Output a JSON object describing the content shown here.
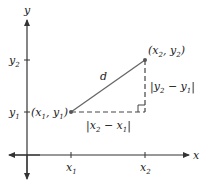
{
  "diagram": {
    "axes": {
      "x_label": "x",
      "y_label": "y",
      "x_ticks": [
        {
          "base": "x",
          "sub": "1"
        },
        {
          "base": "x",
          "sub": "2"
        }
      ],
      "y_ticks": [
        {
          "base": "y",
          "sub": "2"
        },
        {
          "base": "y",
          "sub": "1"
        }
      ]
    },
    "points": {
      "p1": {
        "label": "(x1, y1)"
      },
      "p2": {
        "label": "(x2, y2)"
      }
    },
    "segment_label": "d",
    "horizontal_leg_label": "|x2 − x1|",
    "vertical_leg_label": "|y2 − y1|",
    "colors": {
      "axis": "#333333",
      "segment": "#666666",
      "dashed": "#444444",
      "text": "#222222"
    }
  }
}
